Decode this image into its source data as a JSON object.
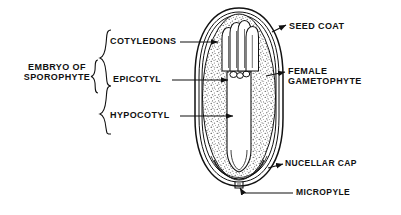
{
  "figure": {
    "background_color": "#ffffff",
    "line_color": "#111111",
    "stipple_color": "#555555",
    "embryo_fill": "#ffffff"
  },
  "labels": {
    "embryo_of_sporophyte": "EMBRYO OF\nSPOROPHYTE",
    "cotyledons": "COTYLEDONS",
    "epicotyl": "EPICOTYL",
    "hypocotyl": "HYPOCOTYL",
    "seed_coat": "SEED COAT",
    "female_gametophyte": "FEMALE\nGAMETOPHYTE",
    "nucellar_cap": "NUCELLAR CAP",
    "micropyle": "MICROPYLE"
  },
  "structures": [
    {
      "name": "seed-coat",
      "side": "right",
      "label": "SEED COAT"
    },
    {
      "name": "female-gametophyte",
      "side": "right",
      "label": "FEMALE GAMETOPHYTE"
    },
    {
      "name": "nucellar-cap",
      "side": "right",
      "label": "NUCELLAR CAP"
    },
    {
      "name": "micropyle",
      "side": "right",
      "label": "MICROPYLE"
    },
    {
      "name": "cotyledons",
      "side": "left",
      "label": "COTYLEDONS"
    },
    {
      "name": "epicotyl",
      "side": "left",
      "label": "EPICOTYL"
    },
    {
      "name": "hypocotyl",
      "side": "left",
      "label": "HYPOCOTYL"
    },
    {
      "name": "embryo-of-sporophyte",
      "side": "left",
      "label": "EMBRYO OF SPOROPHYTE"
    }
  ],
  "braces": {
    "outer_brace_group": [
      "COTYLEDONS",
      "EPICOTYL",
      "HYPOCOTYL"
    ],
    "inner_brace_group": [
      "EMBRYO OF SPOROPHYTE"
    ]
  }
}
